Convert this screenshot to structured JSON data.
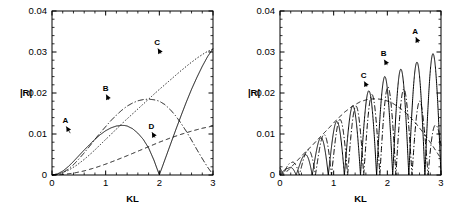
{
  "figure": {
    "panels": [
      "left",
      "right"
    ]
  },
  "chart_data": [
    {
      "id": "left",
      "type": "line",
      "title": "",
      "xlabel": "KL",
      "ylabel": "|R|",
      "xlim": [
        0,
        3
      ],
      "ylim": [
        0,
        0.04
      ],
      "xticks": [
        0,
        1,
        2,
        3
      ],
      "xticklabels": [
        "0",
        "1",
        "2",
        "3"
      ],
      "yticks": [
        0,
        0.01,
        0.02,
        0.03,
        0.04
      ],
      "yticklabels": [
        "0",
        "0.01",
        "0.02",
        "0.03",
        "0.04"
      ],
      "xminor_per_major": 5,
      "yminor_per_major": 5,
      "grid": false,
      "legend": "none",
      "annotations": [
        {
          "label": "A",
          "x": 0.25,
          "y": 0.0128,
          "tip_x": 0.34,
          "tip_y": 0.0102
        },
        {
          "label": "B",
          "x": 1.0,
          "y": 0.0205,
          "tip_x": 1.06,
          "tip_y": 0.0183
        },
        {
          "label": "C",
          "x": 1.96,
          "y": 0.0317,
          "tip_x": 2.03,
          "tip_y": 0.0296
        },
        {
          "label": "D",
          "x": 1.85,
          "y": 0.0113,
          "tip_x": 1.92,
          "tip_y": 0.0091
        }
      ],
      "series": [
        {
          "name": "A",
          "style": "solid",
          "x": [
            0,
            0.1,
            0.2,
            0.3,
            0.4,
            0.5,
            0.6,
            0.7,
            0.8,
            0.9,
            1.0,
            1.1,
            1.2,
            1.3,
            1.35,
            1.4,
            1.5,
            1.6,
            1.7,
            1.8,
            1.9,
            1.95,
            2.0,
            2.05,
            2.1,
            2.2,
            2.3,
            2.4,
            2.5,
            2.6,
            2.7,
            2.8,
            2.9,
            3.0
          ],
          "y": [
            0,
            0.00025,
            0.00095,
            0.002,
            0.0033,
            0.0047,
            0.0061,
            0.0074,
            0.0087,
            0.00985,
            0.0108,
            0.0115,
            0.01195,
            0.0121,
            0.01208,
            0.01195,
            0.0113,
            0.0102,
            0.0087,
            0.0066,
            0.0036,
            0.0018,
            5e-05,
            0.0018,
            0.0036,
            0.0072,
            0.0108,
            0.0143,
            0.0177,
            0.0209,
            0.0238,
            0.0265,
            0.0289,
            0.0308
          ]
        },
        {
          "name": "B",
          "style": "dashdot",
          "x": [
            0,
            0.1,
            0.2,
            0.3,
            0.4,
            0.5,
            0.6,
            0.7,
            0.8,
            0.9,
            1.0,
            1.1,
            1.2,
            1.3,
            1.4,
            1.5,
            1.6,
            1.7,
            1.8,
            1.9,
            1.95,
            2.0,
            2.1,
            2.2,
            2.3,
            2.4,
            2.5,
            2.6,
            2.7,
            2.8,
            2.9,
            3.0
          ],
          "y": [
            0,
            0.00015,
            0.0006,
            0.0014,
            0.0025,
            0.0039,
            0.0054,
            0.007,
            0.0087,
            0.0103,
            0.0118,
            0.0133,
            0.0146,
            0.0158,
            0.0168,
            0.01755,
            0.0181,
            0.0184,
            0.0185,
            0.01835,
            0.0182,
            0.018,
            0.0172,
            0.016,
            0.0145,
            0.0127,
            0.0107,
            0.0085,
            0.0062,
            0.004,
            0.0019,
            0.0001
          ]
        },
        {
          "name": "C",
          "style": "dotted",
          "x": [
            0,
            0.15,
            0.3,
            0.45,
            0.6,
            0.75,
            0.9,
            1.05,
            1.2,
            1.35,
            1.5,
            1.65,
            1.8,
            1.95,
            2.1,
            2.25,
            2.4,
            2.55,
            2.7,
            2.85,
            3.0
          ],
          "y": [
            0,
            0.00035,
            0.0011,
            0.0023,
            0.0038,
            0.0055,
            0.0074,
            0.0093,
            0.0112,
            0.0131,
            0.0149,
            0.0167,
            0.0185,
            0.0203,
            0.022,
            0.0237,
            0.0254,
            0.027,
            0.0285,
            0.0298,
            0.0308
          ]
        },
        {
          "name": "D",
          "style": "dashed",
          "x": [
            0,
            0.2,
            0.4,
            0.6,
            0.8,
            1.0,
            1.2,
            1.4,
            1.6,
            1.8,
            2.0,
            2.2,
            2.4,
            2.6,
            2.8,
            3.0
          ],
          "y": [
            0,
            0.00012,
            0.00045,
            0.001,
            0.00175,
            0.00265,
            0.00365,
            0.0047,
            0.0058,
            0.0069,
            0.008,
            0.009,
            0.0099,
            0.0107,
            0.0114,
            0.01195
          ]
        }
      ]
    },
    {
      "id": "right",
      "type": "line",
      "title": "",
      "xlabel": "KL",
      "ylabel": "|R|",
      "xlim": [
        0,
        3
      ],
      "ylim": [
        0,
        0.04
      ],
      "xticks": [
        0,
        1,
        2,
        3
      ],
      "xticklabels": [
        "0",
        "1",
        "2",
        "3"
      ],
      "yticks": [
        0,
        0.01,
        0.02,
        0.03,
        0.04
      ],
      "yticklabels": [
        "0",
        "0.01",
        "0.02",
        "0.03",
        "0.04"
      ],
      "xminor_per_major": 5,
      "yminor_per_major": 5,
      "grid": false,
      "legend": "none",
      "annotations": [
        {
          "label": "A",
          "x": 2.52,
          "y": 0.0345,
          "tip_x": 2.58,
          "tip_y": 0.0322
        },
        {
          "label": "B",
          "x": 1.93,
          "y": 0.029,
          "tip_x": 2.0,
          "tip_y": 0.0268
        },
        {
          "label": "C",
          "x": 1.56,
          "y": 0.0237,
          "tip_x": 1.62,
          "tip_y": 0.0215
        }
      ],
      "series": [
        {
          "name": "A",
          "style": "solid-oscillating",
          "description": "Rapidly oscillating solid curve, zeros at regular intervals, peak envelope rising to ~0.030 near KL=2.9",
          "oscillation_period": 0.3,
          "zero_offset": 0.0,
          "envelope_peaks_x": [
            0.15,
            0.45,
            0.75,
            1.05,
            1.35,
            1.65,
            1.95,
            2.25,
            2.55,
            2.85
          ],
          "envelope_peaks_y": [
            0.0016,
            0.0048,
            0.009,
            0.013,
            0.0168,
            0.0205,
            0.024,
            0.0258,
            0.0275,
            0.0296
          ]
        },
        {
          "name": "B",
          "style": "dashdot-oscillating",
          "description": "Oscillating dash-dot curve slightly phase-shifted from A, peaks up to ~0.022",
          "oscillation_period": 0.3,
          "zero_offset": 0.06,
          "envelope_peaks_x": [
            0.21,
            0.51,
            0.81,
            1.11,
            1.41,
            1.71,
            2.01,
            2.31,
            2.61,
            2.91
          ],
          "envelope_peaks_y": [
            0.003,
            0.006,
            0.0098,
            0.0135,
            0.0168,
            0.0196,
            0.0215,
            0.021,
            0.018,
            0.012
          ]
        },
        {
          "name": "C",
          "style": "dashed-envelope",
          "description": "Smooth dashed envelope curve, broad maximum ~0.0185 near KL=1.8, decaying to ~0.004 at KL=3",
          "x": [
            0,
            0.15,
            0.3,
            0.45,
            0.6,
            0.75,
            0.9,
            1.05,
            1.2,
            1.35,
            1.5,
            1.65,
            1.8,
            1.95,
            2.1,
            2.25,
            2.4,
            2.55,
            2.7,
            2.85,
            3.0
          ],
          "y": [
            0,
            0.0011,
            0.0032,
            0.0053,
            0.0072,
            0.0093,
            0.0113,
            0.0134,
            0.0153,
            0.0168,
            0.0179,
            0.0185,
            0.0186,
            0.0183,
            0.0175,
            0.0162,
            0.0145,
            0.0123,
            0.0098,
            0.007,
            0.004
          ]
        }
      ]
    }
  ]
}
